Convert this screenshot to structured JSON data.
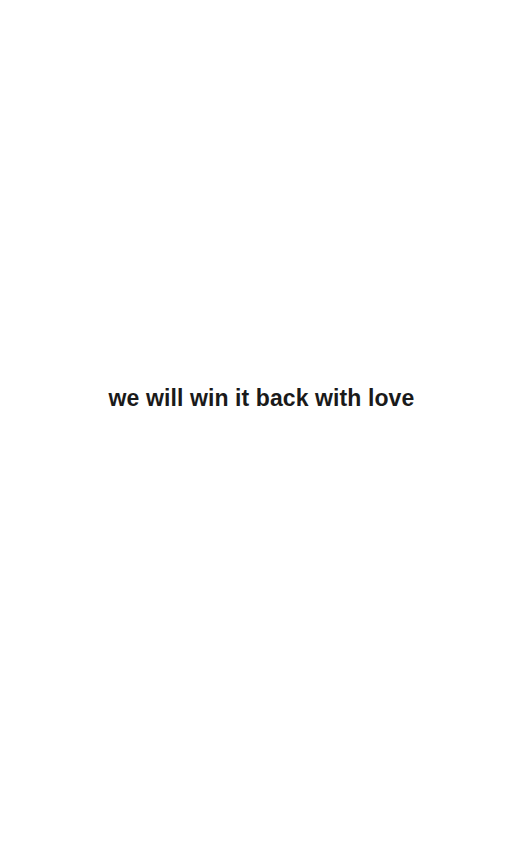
{
  "page": {
    "background_color": "#ffffff",
    "width": 523,
    "height": 865
  },
  "content": {
    "quote": {
      "text": "we will win it back with love",
      "color": "#1a1a1a",
      "alignment": "center",
      "weight": "bold",
      "font_size_px": 23
    }
  }
}
